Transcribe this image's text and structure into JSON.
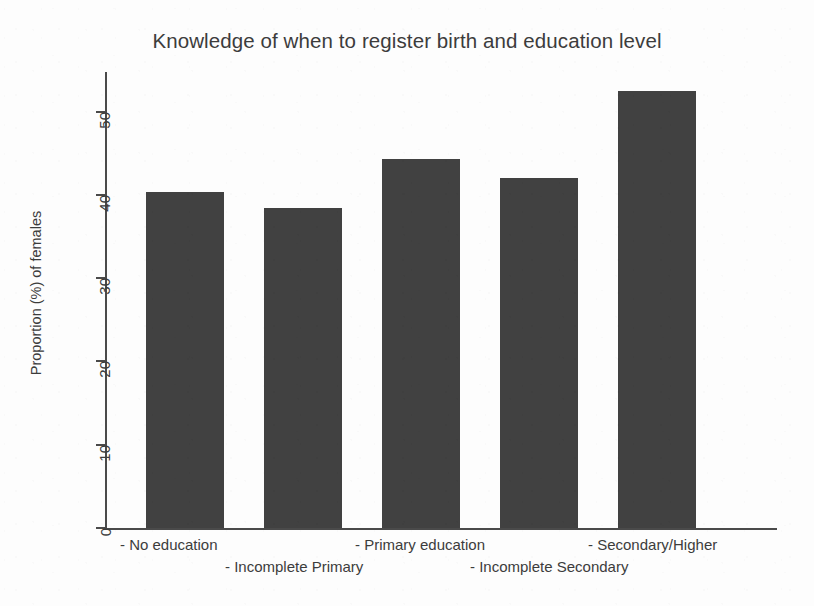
{
  "chart_data": {
    "type": "bar",
    "title": "Knowledge of when to register birth and education level",
    "xlabel": "",
    "ylabel": "Proportion (%) of females",
    "categories": [
      "- No education",
      "- Incomplete Primary",
      "- Primary education",
      "- Incomplete Secondary",
      "- Secondary/Higher"
    ],
    "values": [
      40.4,
      38.4,
      44.3,
      42.0,
      52.5
    ],
    "ylim": [
      0,
      55
    ],
    "yticks": [
      0,
      10,
      20,
      30,
      40,
      50
    ],
    "ytick_labels": [
      "0",
      "10",
      "20",
      "30",
      "40",
      "50"
    ],
    "grid": false,
    "legend": null,
    "bar_color": "#414141",
    "axis_color": "#4a4a4a",
    "text_color": "#3c3c3c",
    "label_rows": [
      {
        "row": "top",
        "labels": [
          "- No education",
          "- Primary education",
          "- Secondary/Higher"
        ]
      },
      {
        "row": "bottom",
        "labels": [
          "- Incomplete Primary",
          "- Incomplete Secondary"
        ]
      }
    ]
  },
  "layout": {
    "x_label_positions_top": [
      120,
      355,
      588
    ],
    "x_label_positions_bottom": [
      225,
      470
    ],
    "bar_lefts": [
      41,
      159,
      277,
      395,
      513
    ],
    "bar_width": 78
  }
}
